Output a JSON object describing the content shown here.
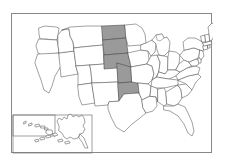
{
  "figure": {
    "type": "choropleth-map",
    "region": "United States",
    "frame": {
      "border_color": "#888888",
      "background": "#ffffff"
    }
  },
  "legend": {
    "highlight_color": "#9a9a9a",
    "default_color": "#ffffff",
    "border_color": "#555555"
  },
  "insets": [
    {
      "name": "hawaii-inset",
      "label": "Hawaii"
    },
    {
      "name": "alaska-inset",
      "label": "Alaska"
    }
  ],
  "map_data": {
    "type": "choropleth",
    "title": "",
    "highlighted_states": [
      "North Dakota",
      "South Dakota",
      "Nebraska",
      "Kansas",
      "Oklahoma"
    ],
    "states": [
      {
        "code": "WA",
        "name": "Washington",
        "highlighted": false
      },
      {
        "code": "OR",
        "name": "Oregon",
        "highlighted": false
      },
      {
        "code": "CA",
        "name": "California",
        "highlighted": false
      },
      {
        "code": "NV",
        "name": "Nevada",
        "highlighted": false
      },
      {
        "code": "ID",
        "name": "Idaho",
        "highlighted": false
      },
      {
        "code": "MT",
        "name": "Montana",
        "highlighted": false
      },
      {
        "code": "WY",
        "name": "Wyoming",
        "highlighted": false
      },
      {
        "code": "UT",
        "name": "Utah",
        "highlighted": false
      },
      {
        "code": "AZ",
        "name": "Arizona",
        "highlighted": false
      },
      {
        "code": "CO",
        "name": "Colorado",
        "highlighted": false
      },
      {
        "code": "NM",
        "name": "New Mexico",
        "highlighted": false
      },
      {
        "code": "ND",
        "name": "North Dakota",
        "highlighted": true
      },
      {
        "code": "SD",
        "name": "South Dakota",
        "highlighted": true
      },
      {
        "code": "NE",
        "name": "Nebraska",
        "highlighted": true
      },
      {
        "code": "KS",
        "name": "Kansas",
        "highlighted": true
      },
      {
        "code": "OK",
        "name": "Oklahoma",
        "highlighted": true
      },
      {
        "code": "TX",
        "name": "Texas",
        "highlighted": false
      },
      {
        "code": "MN",
        "name": "Minnesota",
        "highlighted": false
      },
      {
        "code": "IA",
        "name": "Iowa",
        "highlighted": false
      },
      {
        "code": "MO",
        "name": "Missouri",
        "highlighted": false
      },
      {
        "code": "AR",
        "name": "Arkansas",
        "highlighted": false
      },
      {
        "code": "LA",
        "name": "Louisiana",
        "highlighted": false
      },
      {
        "code": "WI",
        "name": "Wisconsin",
        "highlighted": false
      },
      {
        "code": "IL",
        "name": "Illinois",
        "highlighted": false
      },
      {
        "code": "MI",
        "name": "Michigan",
        "highlighted": false
      },
      {
        "code": "IN",
        "name": "Indiana",
        "highlighted": false
      },
      {
        "code": "OH",
        "name": "Ohio",
        "highlighted": false
      },
      {
        "code": "KY",
        "name": "Kentucky",
        "highlighted": false
      },
      {
        "code": "TN",
        "name": "Tennessee",
        "highlighted": false
      },
      {
        "code": "MS",
        "name": "Mississippi",
        "highlighted": false
      },
      {
        "code": "AL",
        "name": "Alabama",
        "highlighted": false
      },
      {
        "code": "GA",
        "name": "Georgia",
        "highlighted": false
      },
      {
        "code": "FL",
        "name": "Florida",
        "highlighted": false
      },
      {
        "code": "SC",
        "name": "South Carolina",
        "highlighted": false
      },
      {
        "code": "NC",
        "name": "North Carolina",
        "highlighted": false
      },
      {
        "code": "VA",
        "name": "Virginia",
        "highlighted": false
      },
      {
        "code": "WV",
        "name": "West Virginia",
        "highlighted": false
      },
      {
        "code": "MD",
        "name": "Maryland",
        "highlighted": false
      },
      {
        "code": "DE",
        "name": "Delaware",
        "highlighted": false
      },
      {
        "code": "PA",
        "name": "Pennsylvania",
        "highlighted": false
      },
      {
        "code": "NJ",
        "name": "New Jersey",
        "highlighted": false
      },
      {
        "code": "NY",
        "name": "New York",
        "highlighted": false
      },
      {
        "code": "CT",
        "name": "Connecticut",
        "highlighted": false
      },
      {
        "code": "RI",
        "name": "Rhode Island",
        "highlighted": false
      },
      {
        "code": "MA",
        "name": "Massachusetts",
        "highlighted": false
      },
      {
        "code": "VT",
        "name": "Vermont",
        "highlighted": false
      },
      {
        "code": "NH",
        "name": "New Hampshire",
        "highlighted": false
      },
      {
        "code": "ME",
        "name": "Maine",
        "highlighted": false
      },
      {
        "code": "AK",
        "name": "Alaska",
        "highlighted": false
      },
      {
        "code": "HI",
        "name": "Hawaii",
        "highlighted": false
      }
    ]
  }
}
